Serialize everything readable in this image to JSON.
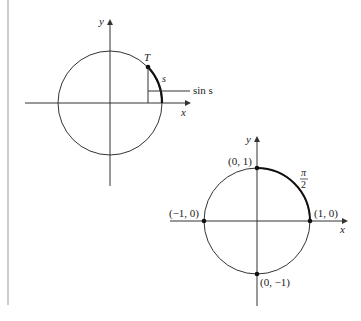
{
  "figure1": {
    "axis_x_label": "x",
    "axis_y_label": "y",
    "point_label": "T",
    "arc_label": "s",
    "segment_label": "sin s"
  },
  "figure2": {
    "axis_x_label": "x",
    "axis_y_label": "y",
    "points": [
      {
        "label": "(0, 1)"
      },
      {
        "label": "(1, 0)"
      },
      {
        "label": "(−1, 0)"
      },
      {
        "label": "(0, −1)"
      }
    ],
    "arc_label_num": "π",
    "arc_label_den": "2"
  },
  "colors": {
    "stroke": "#333333",
    "margin_line": "#888888"
  }
}
